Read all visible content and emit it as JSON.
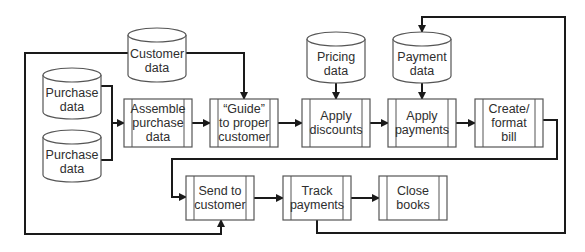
{
  "diagram": {
    "type": "flowchart",
    "data_stores": [
      {
        "id": "customer-data",
        "label": "Customer\ndata",
        "x": 128,
        "y": 28,
        "w": 58,
        "h": 54
      },
      {
        "id": "purchase-data-1",
        "label": "Purchase\ndata",
        "x": 43,
        "y": 68,
        "w": 58,
        "h": 51
      },
      {
        "id": "purchase-data-2",
        "label": "Purchase\ndata",
        "x": 43,
        "y": 130,
        "w": 58,
        "h": 52
      },
      {
        "id": "pricing-data",
        "label": "Pricing\ndata",
        "x": 307,
        "y": 32,
        "w": 58,
        "h": 51
      },
      {
        "id": "payment-data",
        "label": "Payment\ndata",
        "x": 393,
        "y": 32,
        "w": 58,
        "h": 51
      }
    ],
    "processes": [
      {
        "id": "assemble-purchase-data",
        "label": "Assemble\npurchase\ndata",
        "x": 124,
        "y": 99,
        "w": 68,
        "h": 48
      },
      {
        "id": "guide-to-proper-customer",
        "label": "“Guide”\nto proper\ncustomer",
        "x": 210,
        "y": 99,
        "w": 68,
        "h": 48
      },
      {
        "id": "apply-discounts",
        "label": "Apply\ndiscounts",
        "x": 302,
        "y": 99,
        "w": 68,
        "h": 48
      },
      {
        "id": "apply-payments",
        "label": "Apply\npayments",
        "x": 388,
        "y": 99,
        "w": 68,
        "h": 48
      },
      {
        "id": "create-format-bill",
        "label": "Create/\nformat\nbill",
        "x": 475,
        "y": 99,
        "w": 68,
        "h": 48
      },
      {
        "id": "send-to-customer",
        "label": "Send to\ncustomer",
        "x": 186,
        "y": 176,
        "w": 68,
        "h": 44
      },
      {
        "id": "track-payments",
        "label": "Track\npayments",
        "x": 283,
        "y": 176,
        "w": 68,
        "h": 44
      },
      {
        "id": "close-books",
        "label": "Close\nbooks",
        "x": 379,
        "y": 176,
        "w": 68,
        "h": 44
      }
    ],
    "connectors": [
      {
        "from": "purchase-data-1",
        "to": "assemble-purchase-data",
        "points": [
          [
            101,
            86
          ],
          [
            112,
            86
          ],
          [
            112,
            123
          ],
          [
            124,
            123
          ]
        ],
        "arrow": true
      },
      {
        "from": "purchase-data-2",
        "to": "assemble-purchase-data",
        "points": [
          [
            101,
            160
          ],
          [
            112,
            160
          ],
          [
            112,
            123
          ]
        ],
        "arrow": false
      },
      {
        "from": "assemble-purchase-data",
        "to": "guide-to-proper-customer",
        "points": [
          [
            192,
            123
          ],
          [
            210,
            123
          ]
        ],
        "arrow": true
      },
      {
        "from": "customer-data",
        "to": "guide-to-proper-customer",
        "points": [
          [
            186,
            53
          ],
          [
            244,
            53
          ],
          [
            244,
            99
          ]
        ],
        "arrow": true
      },
      {
        "from": "customer-data",
        "to": "send-to-customer",
        "points": [
          [
            128,
            53
          ],
          [
            25,
            53
          ],
          [
            25,
            234
          ],
          [
            221,
            234
          ],
          [
            221,
            220
          ]
        ],
        "arrow": true
      },
      {
        "from": "guide-to-proper-customer",
        "to": "apply-discounts",
        "points": [
          [
            278,
            123
          ],
          [
            302,
            123
          ]
        ],
        "arrow": true
      },
      {
        "from": "pricing-data",
        "to": "apply-discounts",
        "points": [
          [
            336,
            83
          ],
          [
            336,
            99
          ]
        ],
        "arrow": true
      },
      {
        "from": "apply-discounts",
        "to": "apply-payments",
        "points": [
          [
            370,
            123
          ],
          [
            388,
            123
          ]
        ],
        "arrow": true
      },
      {
        "from": "payment-data",
        "to": "apply-payments",
        "points": [
          [
            422,
            83
          ],
          [
            422,
            99
          ]
        ],
        "arrow": true
      },
      {
        "from": "apply-payments",
        "to": "create-format-bill",
        "points": [
          [
            456,
            123
          ],
          [
            475,
            123
          ]
        ],
        "arrow": true
      },
      {
        "from": "create-format-bill",
        "to": "send-to-customer",
        "points": [
          [
            543,
            120
          ],
          [
            557,
            120
          ],
          [
            557,
            159
          ],
          [
            172,
            159
          ],
          [
            172,
            197
          ],
          [
            186,
            197
          ]
        ],
        "arrow": true
      },
      {
        "from": "send-to-customer",
        "to": "track-payments",
        "points": [
          [
            254,
            198
          ],
          [
            283,
            198
          ]
        ],
        "arrow": true
      },
      {
        "from": "track-payments",
        "to": "close-books",
        "points": [
          [
            351,
            198
          ],
          [
            379,
            198
          ]
        ],
        "arrow": true
      },
      {
        "from": "track-payments",
        "to": "payment-data",
        "points": [
          [
            317,
            220
          ],
          [
            317,
            233
          ],
          [
            565,
            233
          ],
          [
            565,
            17
          ],
          [
            422,
            17
          ],
          [
            422,
            32
          ]
        ],
        "arrow": true
      }
    ],
    "colors": {
      "line": "#1a1a1a",
      "shape_stroke": "#555555",
      "fill": "#ffffff",
      "text": "#2e2e2e"
    }
  }
}
